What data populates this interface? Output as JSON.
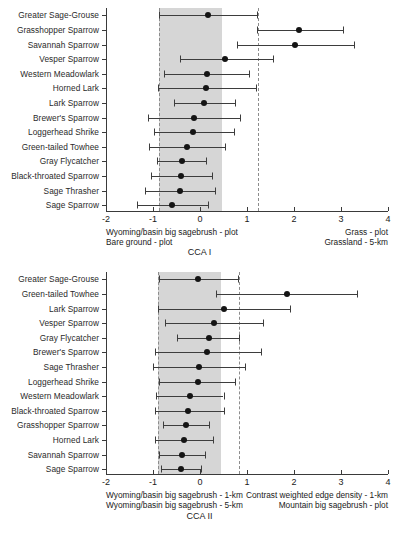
{
  "figure": {
    "type": "forest-plot-pair",
    "background": "#ffffff",
    "band_color": "#d6d6d6",
    "point_color": "#141414",
    "line_color": "#3d3d3d",
    "dash_color": "#8c8c8c"
  },
  "chart_data": [
    {
      "type": "scatter",
      "id": "cca-i",
      "title": "",
      "xlabel": "CCA I",
      "ylabel": "",
      "xlim": [
        -2,
        4
      ],
      "xticks": [
        -2,
        -1,
        0,
        1,
        2,
        3,
        4
      ],
      "xticklabels": [
        "-2",
        "-1",
        "0",
        "1",
        "2",
        "3",
        "4"
      ],
      "grid": false,
      "legend": "none",
      "orientation": "horizontal",
      "shaded_band": {
        "from": -0.88,
        "to": 0.47
      },
      "reference_lines": [
        -0.88,
        1.23
      ],
      "annotations": {
        "left_top": "Wyoming/basin big sagebrush - plot",
        "left_bottom": "Bare ground - plot",
        "right_top": "Grass - plot",
        "right_bottom": "Grassland - 5-km"
      },
      "categories": [
        "Greater Sage-Grouse",
        "Grasshopper Sparrow",
        "Savannah Sparrow",
        "Vesper Sparrow",
        "Western Meadowlark",
        "Horned Lark",
        "Lark Sparrow",
        "Brewer's Sparrow",
        "Loggerhead Shrike",
        "Green-tailed Towhee",
        "Gray Flycatcher",
        "Black-throated Sparrow",
        "Sage Thrasher",
        "Sage Sparrow"
      ],
      "values": [
        0.16,
        2.1,
        2.03,
        0.54,
        0.14,
        0.12,
        0.09,
        -0.13,
        -0.14,
        -0.27,
        -0.38,
        -0.4,
        -0.42,
        -0.6
      ],
      "ci_low": [
        -0.88,
        1.22,
        0.78,
        -0.43,
        -0.76,
        -0.9,
        -0.56,
        -1.1,
        -0.97,
        -1.08,
        -0.92,
        -1.05,
        -1.18,
        -1.34
      ],
      "ci_high": [
        1.22,
        3.05,
        3.28,
        1.55,
        1.05,
        1.2,
        0.75,
        0.86,
        0.73,
        0.53,
        0.13,
        0.26,
        0.32,
        0.17
      ]
    },
    {
      "type": "scatter",
      "id": "cca-ii",
      "title": "",
      "xlabel": "CCA II",
      "ylabel": "",
      "xlim": [
        -2,
        4
      ],
      "xticks": [
        -2,
        -1,
        0,
        1,
        2,
        3,
        4
      ],
      "xticklabels": [
        "-2",
        "-1",
        "0",
        "1",
        "2",
        "3",
        "4"
      ],
      "grid": false,
      "legend": "none",
      "orientation": "horizontal",
      "shaded_band": {
        "from": -0.9,
        "to": 0.45
      },
      "reference_lines": [
        -0.9,
        0.83
      ],
      "annotations": {
        "left_top": "Wyoming/basin big sagebrush - 1-km",
        "left_bottom": "Wyoming/basin big sagebrush - 5-km",
        "right_top": "Contrast weighted edge density - 1-km",
        "right_bottom": "Mountain big sagebrush - plot"
      },
      "categories": [
        "Greater Sage-Grouse",
        "Green-tailed Towhee",
        "Lark Sparrow",
        "Vesper Sparrow",
        "Gray Flycatcher",
        "Brewer's Sparrow",
        "Sage Thrasher",
        "Loggerhead Shrike",
        "Western Meadowlark",
        "Black-throated Sparrow",
        "Grasshopper Sparrow",
        "Horned Lark",
        "Savannah Sparrow",
        "Sage Sparrow"
      ],
      "values": [
        -0.04,
        1.86,
        0.5,
        0.3,
        0.2,
        0.15,
        -0.02,
        -0.05,
        -0.22,
        -0.25,
        -0.3,
        -0.34,
        -0.38,
        -0.4
      ],
      "ci_low": [
        -0.88,
        0.33,
        -0.9,
        -0.74,
        -0.5,
        -0.96,
        -1.0,
        -0.88,
        -0.94,
        -0.96,
        -0.78,
        -0.96,
        -0.88,
        -0.82
      ],
      "ci_high": [
        0.8,
        3.35,
        1.92,
        1.33,
        0.82,
        1.3,
        0.96,
        0.74,
        0.5,
        0.52,
        0.2,
        0.28,
        0.1,
        0.02
      ]
    }
  ]
}
